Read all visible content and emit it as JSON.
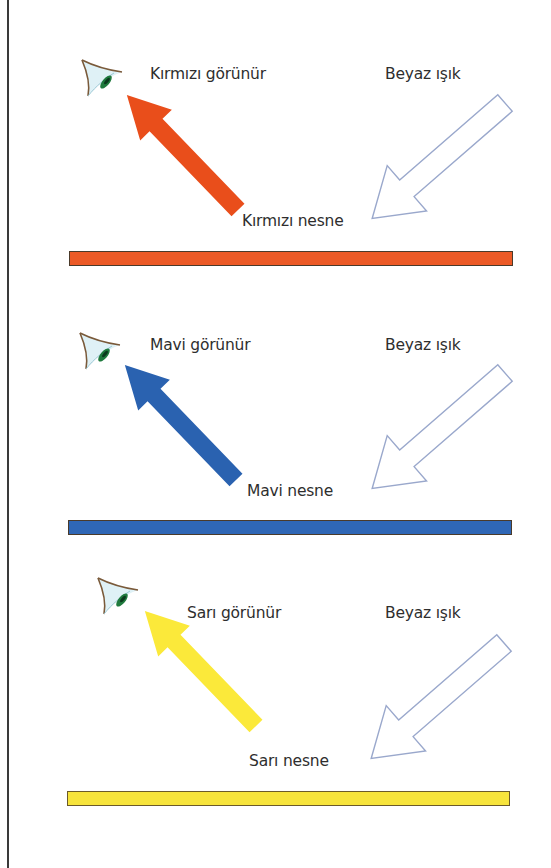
{
  "panels": [
    {
      "id": "red",
      "seen_label": "Kırmızı görünür",
      "light_label": "Beyaz ışık",
      "object_label": "Kırmızı nesne",
      "color": "#e94e1b",
      "bar_color": "#ec5a26"
    },
    {
      "id": "blue",
      "seen_label": "Mavi görünür",
      "light_label": "Beyaz ışık",
      "object_label": "Mavi nesne",
      "color": "#2a62b0",
      "bar_color": "#2f67b6"
    },
    {
      "id": "yellow",
      "seen_label": "Sarı görünür",
      "light_label": "Beyaz ışık",
      "object_label": "Sarı nesne",
      "color": "#fbe93a",
      "bar_color": "#f7e43c"
    }
  ],
  "colors": {
    "white_light_outline": "#9aa8cc",
    "eye_outline": "#7a5a3a",
    "eye_fill": "#dff1f6",
    "iris": "#1f7a3e",
    "frame": "#3a3a3a"
  },
  "icons": {
    "eye": "eye-icon",
    "reflected_arrow": "arrow-up-left-icon",
    "incoming_light_arrow": "arrow-down-left-outline-icon"
  }
}
